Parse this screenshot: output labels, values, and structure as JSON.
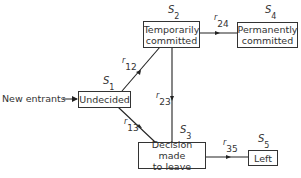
{
  "diagram": {
    "entry_label": "New entrants",
    "states": [
      {
        "id": "S1",
        "symbol": "S",
        "sub": "1",
        "label": "Undecided"
      },
      {
        "id": "S2",
        "symbol": "S",
        "sub": "2",
        "label": "Temporarily committed"
      },
      {
        "id": "S3",
        "symbol": "S",
        "sub": "3",
        "label": "Decision made to leave"
      },
      {
        "id": "S4",
        "symbol": "S",
        "sub": "4",
        "label": "Permanently committed"
      },
      {
        "id": "S5",
        "symbol": "S",
        "sub": "5",
        "label": "Left"
      }
    ],
    "transitions": [
      {
        "symbol": "r",
        "sub": "12",
        "from": "S1",
        "to": "S2"
      },
      {
        "symbol": "r",
        "sub": "13",
        "from": "S1",
        "to": "S3"
      },
      {
        "symbol": "r",
        "sub": "23",
        "from": "S2",
        "to": "S3"
      },
      {
        "symbol": "r",
        "sub": "24",
        "from": "S2",
        "to": "S4"
      },
      {
        "symbol": "r",
        "sub": "35",
        "from": "S3",
        "to": "S5"
      }
    ],
    "box_text": {
      "s1": "Undecided",
      "s2_line1": "Temporarily",
      "s2_line2": "committed",
      "s3_line1": "Decision made",
      "s3_line2": "to leave",
      "s4_line1": "Permanently",
      "s4_line2": "committed",
      "s5": "Left"
    }
  }
}
